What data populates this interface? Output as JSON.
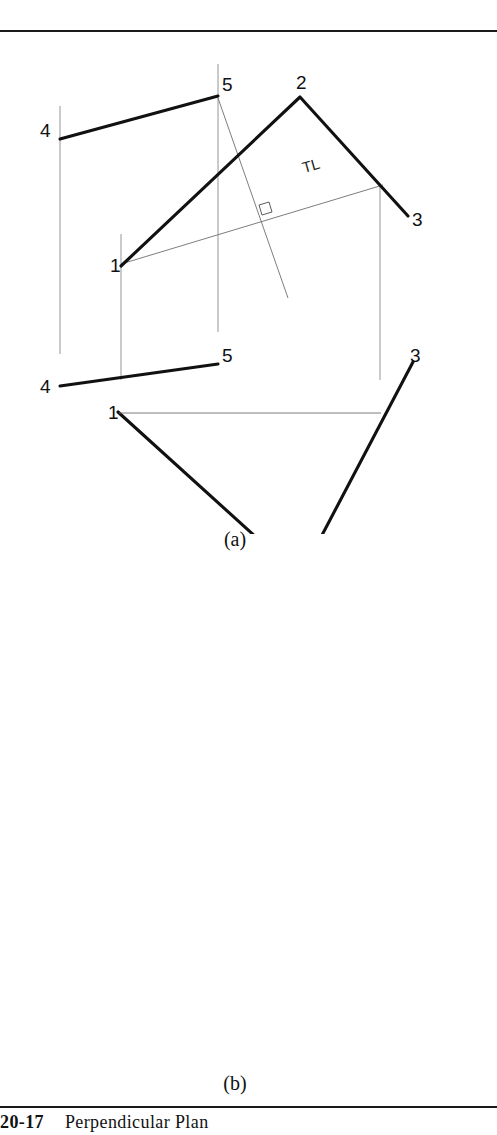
{
  "figure": {
    "caption_number": "20-17",
    "caption_text": "Perpendicular Plan",
    "subfigure_a_label": "(a)",
    "subfigure_b_label": "(b)",
    "tl_label": "TL"
  },
  "figure_a": {
    "top_view": {
      "vertex_labels": [
        "4",
        "5",
        "2",
        "3",
        "1"
      ],
      "points": {
        "4": [
          60,
          105
        ],
        "5": [
          218,
          62
        ],
        "2": [
          300,
          63
        ],
        "3": [
          408,
          182
        ],
        "1": [
          121,
          232
        ]
      },
      "tl_label": "TL"
    },
    "front_view": {
      "vertex_labels": [
        "4",
        "5",
        "1",
        "3",
        "2"
      ],
      "points": {
        "4": [
          60,
          352
        ],
        "5": [
          218,
          330
        ],
        "1": [
          118,
          378
        ],
        "3": [
          413,
          328
        ],
        "2": [
          300,
          543
        ]
      }
    },
    "label": "(a)"
  },
  "figure_b": {
    "top_view": {
      "vertex_labels": [
        "4",
        "5",
        "2",
        "3",
        "1",
        "6"
      ],
      "points": {
        "4": [
          61,
          636
        ],
        "5": [
          221,
          600
        ],
        "2": [
          298,
          598
        ],
        "3": [
          410,
          714
        ],
        "1": [
          121,
          757
        ],
        "6": [
          287,
          785
        ]
      }
    },
    "front_view": {
      "vertex_labels": [
        "4",
        "5",
        "1",
        "3",
        "6",
        "2"
      ],
      "points": {
        "4": [
          61,
          894
        ],
        "5": [
          221,
          862
        ],
        "1": [
          123,
          910
        ],
        "3": [
          410,
          860
        ],
        "6": [
          286,
          988
        ],
        "2": [
          302,
          1075
        ]
      },
      "tl_label": "TL"
    },
    "label": "(b)"
  }
}
